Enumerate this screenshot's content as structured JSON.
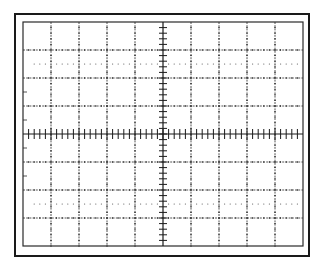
{
  "diagram": {
    "type": "oscilloscope-graticule",
    "divisions": {
      "horizontal": 10,
      "vertical": 8
    },
    "subdivisions_per_division": 5,
    "dotted_reference_lines": "1 division inside top and bottom edges (at 1.5 div from center? no: at ±2.5 div)",
    "colors": {
      "background": "#ffffff",
      "frame": "#1a1a1a",
      "grid": "#2a2a2a",
      "dotted": "#555555"
    },
    "geometry": {
      "outer_frame": {
        "x": 15,
        "y": 14,
        "w": 294,
        "h": 242,
        "stroke": 2
      },
      "inner_grid": {
        "x": 23,
        "y": 22,
        "w": 280,
        "h": 224
      },
      "division_px": 28,
      "axis_tick_half_len_h": 5,
      "axis_tick_half_len_v": 4,
      "minor_tick_len": 2,
      "dotted_rows_y": [
        64,
        204
      ],
      "left_edge_ticks_y": [
        92,
        120,
        148,
        176
      ],
      "left_edge_tick_len": 4
    }
  }
}
